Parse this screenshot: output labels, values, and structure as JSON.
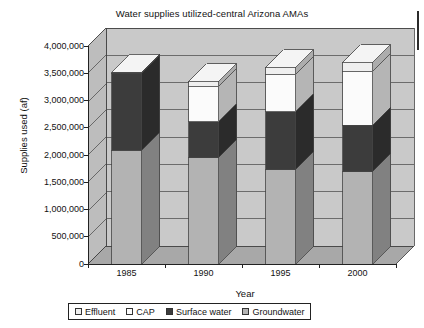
{
  "chart_data": {
    "type": "bar",
    "subtype": "stacked-3d-column",
    "title": "Water supplies utilized-central Arizona AMAs",
    "xlabel": "Year",
    "ylabel": "Supplies used (af)",
    "categories": [
      "1985",
      "1990",
      "1995",
      "2000"
    ],
    "ylim": [
      0,
      4000000
    ],
    "ytick_values": [
      0,
      500000,
      1000000,
      1500000,
      2000000,
      2500000,
      3000000,
      3500000,
      4000000
    ],
    "ytick_labels": [
      "0",
      "500,000",
      "1,000,000",
      "1,500,000",
      "2,000,000",
      "2,500,000",
      "3,000,000",
      "3,500,000",
      "4,000,000"
    ],
    "grid": true,
    "legend_position": "bottom",
    "stack_order_bottom_to_top": [
      "Groundwater",
      "Surface water",
      "CAP",
      "Effluent"
    ],
    "series": [
      {
        "name": "Groundwater",
        "color": "#b3b3b3",
        "values": [
          2090000,
          1950000,
          1730000,
          1690000
        ]
      },
      {
        "name": "Surface water",
        "color": "#3c3c3c",
        "values": [
          1410000,
          660000,
          1060000,
          860000
        ]
      },
      {
        "name": "CAP",
        "color": "#fbfbfb",
        "values": [
          0,
          640000,
          680000,
          980000
        ]
      },
      {
        "name": "Effluent",
        "color": "#efefef",
        "values": [
          20000,
          90000,
          130000,
          160000
        ]
      }
    ],
    "totals": [
      3520000,
      3340000,
      3600000,
      3690000
    ]
  },
  "legend": {
    "items": [
      {
        "label": "Effluent",
        "color": "#efefef"
      },
      {
        "label": "CAP",
        "color": "#fbfbfb"
      },
      {
        "label": "Surface water",
        "color": "#3c3c3c"
      },
      {
        "label": "Groundwater",
        "color": "#b3b3b3"
      }
    ]
  },
  "style": {
    "wall_back": "#c9c9c9",
    "wall_side": "#bdbdbd",
    "floor": "#a8a8a8",
    "outline": "#444444",
    "text": "#121212"
  }
}
